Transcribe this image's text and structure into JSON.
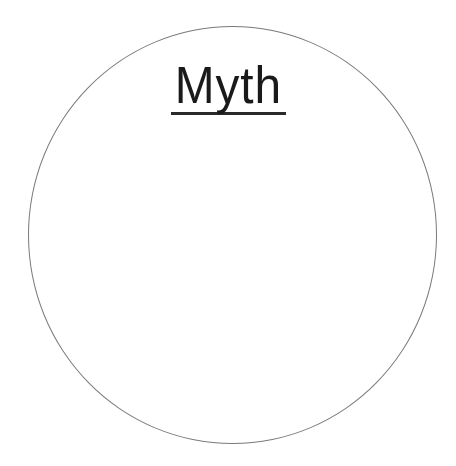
{
  "diagram": {
    "shape": "circle",
    "title": "Myth",
    "title_underlined": true,
    "stroke_color": "#7a7a7a",
    "text_color": "#1a1a1a",
    "background": "#ffffff"
  }
}
